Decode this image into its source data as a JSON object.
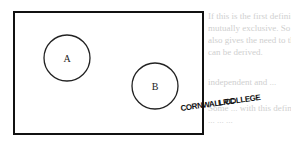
{
  "diagram": {
    "type": "venn",
    "universe": {
      "x": 14,
      "y": 12,
      "width": 189,
      "height": 122
    },
    "sets": [
      {
        "label": "A",
        "cx": 67,
        "cy": 58,
        "r": 23
      },
      {
        "label": "B",
        "cx": 155,
        "cy": 86,
        "r": 23
      }
    ]
  },
  "stamp": {
    "line1": "CORNWALL COLLEGE",
    "line2": "LRC"
  },
  "background_text": [
    "If this is the first definition ...",
    "mutually exclusive. So the second definition of ...",
    "also gives the need to the previous section ...",
    "can be derived.",
    "independent and ...",
    "Some ... with this definition ...",
    "... ... ..."
  ]
}
